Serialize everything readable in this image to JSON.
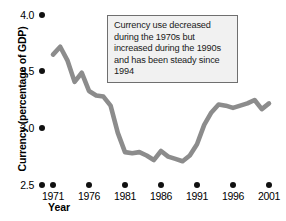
{
  "chart_data": {
    "type": "line",
    "title": "",
    "xlabel": "Year",
    "ylabel": "Currency (percentage of GDP)",
    "xlim": [
      1970,
      2002
    ],
    "ylim": [
      2.5,
      4.0
    ],
    "grid": false,
    "legend": false,
    "line_color": "#8c8c8c",
    "x_ticks": [
      "1971",
      "1976",
      "1981",
      "1986",
      "1991",
      "1996",
      "2001"
    ],
    "y_ticks": [
      "2.5",
      "3.0",
      "3.5",
      "4.0"
    ],
    "annotation": "Currency use decreased during the 1970s but increased during the 1990s and has been steady since 1994",
    "series": [
      {
        "name": "Currency as percentage of GDP",
        "x": [
          1971,
          1972,
          1973,
          1974,
          1975,
          1976,
          1977,
          1978,
          1979,
          1980,
          1981,
          1982,
          1983,
          1984,
          1985,
          1986,
          1987,
          1988,
          1989,
          1990,
          1991,
          1992,
          1993,
          1994,
          1995,
          1996,
          1997,
          1998,
          1999,
          2000,
          2001
        ],
        "values": [
          3.65,
          3.72,
          3.6,
          3.41,
          3.49,
          3.33,
          3.29,
          3.28,
          3.2,
          2.96,
          2.79,
          2.78,
          2.79,
          2.76,
          2.72,
          2.8,
          2.75,
          2.73,
          2.71,
          2.76,
          2.86,
          3.03,
          3.14,
          3.21,
          3.2,
          3.18,
          3.2,
          3.22,
          3.25,
          3.17,
          3.22
        ]
      }
    ]
  },
  "y_tick_labels": [
    "4.0",
    "3.5",
    "3.0",
    "2.5"
  ],
  "x_tick_labels": [
    "1971",
    "1976",
    "1981",
    "1986",
    "1991",
    "1996",
    "2001"
  ],
  "axis_titles": {
    "y": "Currency (percentage of GDP)",
    "x": "Year"
  },
  "callout": {
    "text": "Currency use decreased during the 1970s but increased during the 1990s and has been steady since 1994"
  }
}
